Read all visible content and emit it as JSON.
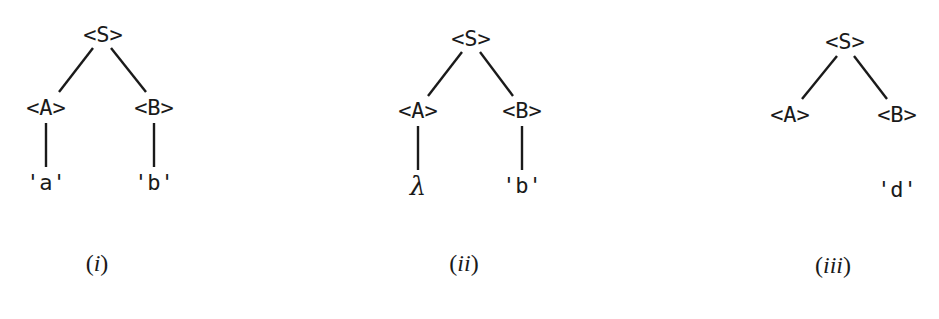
{
  "figure": {
    "trees": [
      {
        "id": "i",
        "caption_open": "(",
        "caption_label": "i",
        "caption_close": ")",
        "root": "<S>",
        "children": [
          {
            "label": "<A>",
            "leaf": "'a'",
            "connected": true
          },
          {
            "label": "<B>",
            "leaf": "'b'",
            "connected": true
          }
        ]
      },
      {
        "id": "ii",
        "caption_open": "(",
        "caption_label": "ii",
        "caption_close": ")",
        "root": "<S>",
        "children": [
          {
            "label": "<A>",
            "leaf": "λ",
            "connected": true
          },
          {
            "label": "<B>",
            "leaf": "'b'",
            "connected": true
          }
        ]
      },
      {
        "id": "iii",
        "caption_open": "(",
        "caption_label": "iii",
        "caption_close": ")",
        "root": "<S>",
        "children": [
          {
            "label": "<A>",
            "leaf": null,
            "connected": false
          },
          {
            "label": "<B>",
            "leaf": "'d'",
            "connected": false
          }
        ]
      }
    ]
  },
  "colors": {
    "ink": "#1a1a1a",
    "background": "#ffffff"
  }
}
